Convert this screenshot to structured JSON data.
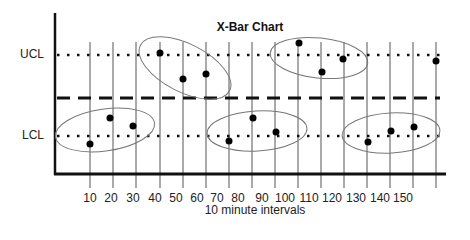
{
  "chart_data": {
    "type": "scatter",
    "title": "X-Bar Chart",
    "xlabel": "10 minute intervals",
    "ylabel": "",
    "x_tick_labels": [
      "10",
      "20",
      "30",
      "40",
      "50",
      "60",
      "70",
      "80",
      "90",
      "100",
      "110",
      "120",
      "130",
      "140",
      "150"
    ],
    "control_lines": [
      {
        "name": "UCL",
        "label": "UCL",
        "style": "dotted",
        "y_px": 55
      },
      {
        "name": "Center line",
        "label": "",
        "style": "dashed",
        "y_px": 98
      },
      {
        "name": "LCL",
        "label": "LCL",
        "style": "dotted",
        "y_px": 136
      }
    ],
    "points": [
      {
        "x_px": 90,
        "y_px": 144,
        "position": "below LCL"
      },
      {
        "x_px": 110,
        "y_px": 118,
        "position": "between LCL and center"
      },
      {
        "x_px": 133,
        "y_px": 126,
        "position": "between LCL and center"
      },
      {
        "x_px": 160,
        "y_px": 53,
        "position": "at UCL"
      },
      {
        "x_px": 183,
        "y_px": 79,
        "position": "between center and UCL"
      },
      {
        "x_px": 206,
        "y_px": 74,
        "position": "between center and UCL"
      },
      {
        "x_px": 229,
        "y_px": 141,
        "position": "below LCL"
      },
      {
        "x_px": 253,
        "y_px": 118,
        "position": "between LCL and center"
      },
      {
        "x_px": 276,
        "y_px": 132,
        "position": "near LCL"
      },
      {
        "x_px": 299,
        "y_px": 43,
        "position": "above UCL"
      },
      {
        "x_px": 322,
        "y_px": 72,
        "position": "between center and UCL"
      },
      {
        "x_px": 343,
        "y_px": 59,
        "position": "near UCL"
      },
      {
        "x_px": 368,
        "y_px": 142,
        "position": "below LCL"
      },
      {
        "x_px": 391,
        "y_px": 131,
        "position": "near LCL"
      },
      {
        "x_px": 414,
        "y_px": 127,
        "position": "near LCL"
      },
      {
        "x_px": 436,
        "y_px": 61,
        "position": "near UCL"
      }
    ],
    "groupings": [
      {
        "name": "group-1",
        "cx": 105,
        "cy": 130,
        "rx": 50,
        "ry": 21,
        "rotate": -8
      },
      {
        "name": "group-2",
        "cx": 185,
        "cy": 68,
        "rx": 50,
        "ry": 24,
        "rotate": 27
      },
      {
        "name": "group-3",
        "cx": 257,
        "cy": 131,
        "rx": 50,
        "ry": 20,
        "rotate": -3
      },
      {
        "name": "group-4",
        "cx": 319,
        "cy": 58,
        "rx": 49,
        "ry": 20,
        "rotate": 6
      },
      {
        "name": "group-5",
        "cx": 391,
        "cy": 133,
        "rx": 49,
        "ry": 20,
        "rotate": -3
      }
    ],
    "grid": {
      "vertical_lines_px": [
        90,
        113,
        136,
        160,
        183,
        206,
        229,
        252,
        275,
        298,
        321,
        344,
        367,
        390,
        413,
        436
      ]
    },
    "legend": null
  },
  "labels": {
    "title": "X-Bar Chart",
    "ucl": "UCL",
    "lcl": "LCL",
    "xlabel": "10 minute intervals",
    "ticks": [
      {
        "text": "10",
        "x": 90
      },
      {
        "text": "20",
        "x": 111
      },
      {
        "text": "30",
        "x": 133
      },
      {
        "text": "40",
        "x": 155
      },
      {
        "text": "50",
        "x": 176
      },
      {
        "text": "60",
        "x": 197
      },
      {
        "text": "70",
        "x": 217
      },
      {
        "text": "80",
        "x": 238
      },
      {
        "text": "90",
        "x": 262
      },
      {
        "text": "100",
        "x": 285
      },
      {
        "text": "110",
        "x": 309
      },
      {
        "text": "120",
        "x": 332
      },
      {
        "text": "130",
        "x": 356
      },
      {
        "text": "140",
        "x": 380
      },
      {
        "text": "150",
        "x": 403
      }
    ]
  },
  "colors": {
    "line": "#111111",
    "grid": "#555555",
    "ellipse": "#777777",
    "point": "#000000"
  }
}
